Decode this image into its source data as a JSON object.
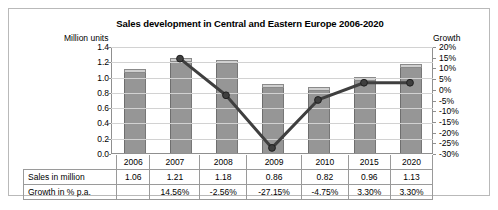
{
  "chart_data": {
    "type": "bar",
    "title": "Sales development in Central and Eastern Europe 2006-2020",
    "categories": [
      "2006",
      "2007",
      "2008",
      "2009",
      "2010",
      "2015",
      "2020"
    ],
    "series": [
      {
        "name": "Sales in million",
        "type": "bar",
        "axis": "left",
        "values": [
          1.06,
          1.21,
          1.18,
          0.86,
          0.82,
          0.96,
          1.13
        ]
      },
      {
        "name": "Growth in % p.a.",
        "type": "line",
        "axis": "right",
        "values": [
          null,
          14.56,
          -2.56,
          -27.15,
          -4.75,
          3.3,
          3.3
        ]
      }
    ],
    "ylabel": "Million units",
    "ylabel_right": "Growth",
    "ylim": [
      0.0,
      1.4
    ],
    "ylim_right": [
      -30,
      20
    ],
    "yticks": [
      "0.0",
      "0.2",
      "0.4",
      "0.6",
      "0.8",
      "1.0",
      "1.2",
      "1.4"
    ],
    "yticks_right": [
      "-30%",
      "-25%",
      "-20%",
      "-15%",
      "-10%",
      "-5%",
      "0%",
      "5%",
      "10%",
      "15%",
      "20%"
    ],
    "xlabel": "",
    "grid": true,
    "legend": "none",
    "colors": {
      "bar_fill": "#969696",
      "bar_cap": "#cfcfcf",
      "line": "#3f3f3f",
      "marker": "#3f3f3f",
      "grid": "#d2d2d2",
      "axis": "#8f8f8f",
      "frame": "#b9b9b9"
    }
  },
  "table": {
    "row_labels": [
      "Sales in million",
      "Growth in % p.a."
    ],
    "categories": [
      "2006",
      "2007",
      "2008",
      "2009",
      "2010",
      "2015",
      "2020"
    ],
    "rows": [
      [
        "1.06",
        "1.21",
        "1.18",
        "0.86",
        "0.82",
        "0.96",
        "1.13"
      ],
      [
        "",
        "14.56%",
        "-2.56%",
        "-27.15%",
        "-4.75%",
        "3.30%",
        "3.30%"
      ]
    ]
  }
}
